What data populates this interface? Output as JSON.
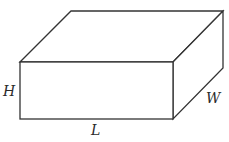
{
  "diagram": {
    "type": "rectangular-prism",
    "stroke_color": "#333333",
    "fill_color": "#ffffff",
    "labels": {
      "height": "H",
      "length": "L",
      "width": "W"
    }
  }
}
